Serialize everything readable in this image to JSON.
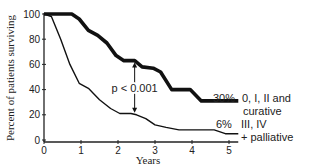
{
  "chart_data": {
    "type": "line",
    "title": "",
    "xlabel": "Years",
    "ylabel": "Percent of patients surviving",
    "xlim": [
      0,
      5.25
    ],
    "ylim": [
      0,
      100
    ],
    "x_ticks": [
      "0",
      "1",
      "2",
      "3",
      "4",
      "5"
    ],
    "y_ticks": [
      "0",
      "20",
      "40",
      "60",
      "80",
      "100"
    ],
    "grid": false,
    "series": [
      {
        "name": "0, I, II and curative",
        "end_label": "30%",
        "label_line1": "0, I, II and",
        "label_line2": "curative",
        "style": "thick",
        "points": [
          [
            0,
            100
          ],
          [
            0.75,
            100
          ],
          [
            0.95,
            96
          ],
          [
            1.2,
            87
          ],
          [
            1.45,
            83
          ],
          [
            1.7,
            77
          ],
          [
            1.95,
            67
          ],
          [
            2.15,
            63
          ],
          [
            2.45,
            63
          ],
          [
            2.65,
            58
          ],
          [
            2.95,
            57
          ],
          [
            3.15,
            54
          ],
          [
            3.45,
            40
          ],
          [
            3.95,
            40
          ],
          [
            4.25,
            31
          ],
          [
            5.25,
            31
          ]
        ]
      },
      {
        "name": "III, IV + palliative",
        "end_label": "6%",
        "label_line1": "III, IV",
        "label_line2": "+ palliative",
        "style": "thin",
        "points": [
          [
            0,
            100
          ],
          [
            0.2,
            98
          ],
          [
            0.45,
            80
          ],
          [
            0.7,
            60
          ],
          [
            0.95,
            45
          ],
          [
            1.2,
            41
          ],
          [
            1.5,
            32
          ],
          [
            1.8,
            25
          ],
          [
            2.05,
            21
          ],
          [
            2.35,
            21
          ],
          [
            2.5,
            20
          ],
          [
            2.75,
            17
          ],
          [
            3.0,
            12
          ],
          [
            3.3,
            10
          ],
          [
            3.65,
            8
          ],
          [
            4.6,
            8
          ],
          [
            4.9,
            5
          ],
          [
            5.25,
            5
          ]
        ]
      }
    ],
    "annotations": [
      {
        "text": "p < 0.001",
        "type": "double-arrow",
        "x": 2.45,
        "y_from": 63,
        "y_to": 20
      }
    ]
  }
}
